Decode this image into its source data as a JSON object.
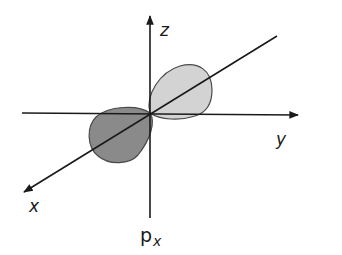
{
  "diagram": {
    "axes": [
      {
        "name": "z",
        "label": "z"
      },
      {
        "name": "y",
        "label": "y"
      },
      {
        "name": "x",
        "label": "x"
      }
    ],
    "caption": {
      "main": "p",
      "subscript": "x"
    },
    "lobes": [
      {
        "name": "positive-lobe",
        "color": "#d3d3d3"
      },
      {
        "name": "negative-lobe",
        "color": "#8a8a8a"
      }
    ],
    "colors": {
      "line": "#1a1a1a",
      "light_lobe": "#d3d3d3",
      "dark_lobe": "#8a8a8a"
    }
  }
}
